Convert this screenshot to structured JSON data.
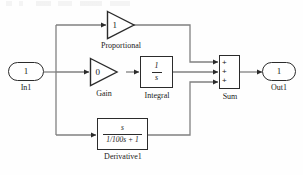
{
  "diagram": {
    "type": "simulink-block-diagram",
    "background_color": "#fefefe",
    "line_color": "#808080",
    "block_border_color": "#2b2b2b",
    "text_color": "#1a1a1a"
  },
  "blocks": {
    "input_port": {
      "label": "In1",
      "value": "1",
      "kind": "inport"
    },
    "proportional": {
      "label": "Proportional",
      "value": "1",
      "kind": "gain"
    },
    "gain": {
      "label": "Gain",
      "value": "0",
      "kind": "gain"
    },
    "integral": {
      "label": "Integral",
      "numerator": "1",
      "denominator": "s",
      "kind": "transfer-function"
    },
    "derivative": {
      "label": "Derivative1",
      "numerator": "s",
      "denominator": "1/100s + 1",
      "kind": "transfer-function"
    },
    "sum": {
      "label": "Sum",
      "signs": [
        "+",
        "+",
        "+"
      ],
      "kind": "sum"
    },
    "output_port": {
      "label": "Out1",
      "value": "1",
      "kind": "outport"
    }
  },
  "signals": [
    {
      "name": "in-to-branch",
      "from": "input_port",
      "to": "branch"
    },
    {
      "name": "branch-to-proportional",
      "from": "branch",
      "to": "proportional"
    },
    {
      "name": "branch-to-gain",
      "from": "branch",
      "to": "gain"
    },
    {
      "name": "branch-to-derivative",
      "from": "branch",
      "to": "derivative"
    },
    {
      "name": "gain-to-integral",
      "from": "gain",
      "to": "integral"
    },
    {
      "name": "proportional-to-sum",
      "from": "proportional",
      "to": "sum"
    },
    {
      "name": "integral-to-sum",
      "from": "integral",
      "to": "sum"
    },
    {
      "name": "derivative-to-sum",
      "from": "derivative",
      "to": "sum"
    },
    {
      "name": "sum-to-output",
      "from": "sum",
      "to": "output_port"
    }
  ]
}
